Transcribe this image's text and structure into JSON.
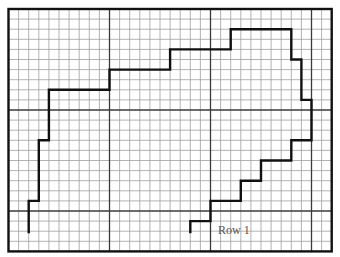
{
  "diagram": {
    "type": "graph-paper-pattern",
    "grid": {
      "columns": 32,
      "rows": 24,
      "origin_x": 8.5,
      "origin_y": 9,
      "cell_size": 10.1,
      "major_every": 10,
      "minor_color": "#a0a0a0",
      "major_color": "#3a3a3a",
      "border_color": "#111111"
    },
    "outline": {
      "color": "#111111",
      "width": 2.4,
      "points": [
        [
          2,
          22.2
        ],
        [
          2,
          19
        ],
        [
          3,
          19
        ],
        [
          3,
          13
        ],
        [
          4,
          13
        ],
        [
          4,
          8
        ],
        [
          10,
          8
        ],
        [
          10,
          6
        ],
        [
          16,
          6
        ],
        [
          16,
          4
        ],
        [
          22,
          4
        ],
        [
          22,
          2
        ],
        [
          28,
          2
        ],
        [
          28,
          5
        ],
        [
          29,
          5
        ],
        [
          29,
          9
        ],
        [
          30,
          9
        ],
        [
          30,
          13
        ],
        [
          28,
          13
        ],
        [
          28,
          15
        ],
        [
          25,
          15
        ],
        [
          25,
          17
        ],
        [
          23,
          17
        ],
        [
          23,
          19
        ],
        [
          20,
          19
        ],
        [
          20,
          21
        ],
        [
          18,
          21
        ],
        [
          18,
          22.2
        ]
      ]
    },
    "label": {
      "text": "Row 1",
      "x": 218,
      "y": 224
    }
  }
}
